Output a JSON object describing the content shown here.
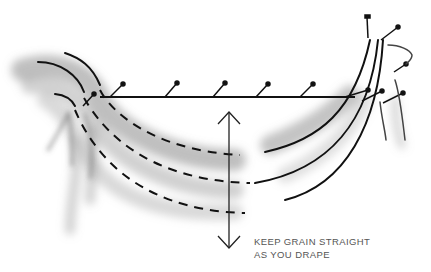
{
  "diagram": {
    "caption": {
      "line1": "KEEP GRAIN STRAIGHT",
      "line2": "AS YOU DRAPE"
    },
    "elements": {
      "pinned_line": "horizontal tape line with 5 pins",
      "grain_lines": 3,
      "arrow": "double-headed vertical arrow"
    },
    "colors": {
      "ink": "#111111",
      "shade": "#9a9a9a",
      "caption": "#555555"
    }
  }
}
